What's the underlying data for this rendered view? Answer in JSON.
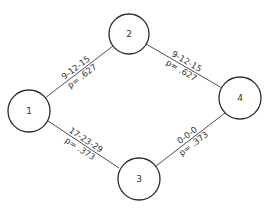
{
  "diagram": {
    "type": "network",
    "nodes": [
      {
        "id": "1",
        "label": "1",
        "cx": 29,
        "cy": 111,
        "r": 21
      },
      {
        "id": "2",
        "label": "2",
        "cx": 129,
        "cy": 34,
        "r": 20
      },
      {
        "id": "3",
        "label": "3",
        "cx": 139,
        "cy": 179,
        "r": 21
      },
      {
        "id": "4",
        "label": "4",
        "cx": 240,
        "cy": 98,
        "r": 21
      }
    ],
    "edges": [
      {
        "from": "1",
        "to": "2",
        "times": "9-12-15",
        "probability": "p= .627"
      },
      {
        "from": "2",
        "to": "4",
        "times": "9-12-15",
        "probability": "p= .627"
      },
      {
        "from": "1",
        "to": "3",
        "times": "17-23-29",
        "probability": "p= .373"
      },
      {
        "from": "3",
        "to": "4",
        "times": "0-0-0",
        "probability": "p= .373"
      }
    ]
  }
}
